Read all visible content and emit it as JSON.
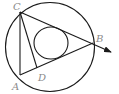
{
  "diagram": {
    "type": "geometry",
    "points": {
      "A": {
        "label": "A"
      },
      "B": {
        "label": "B"
      },
      "C": {
        "label": "C"
      },
      "D": {
        "label": "D"
      }
    },
    "segments": [
      "CA",
      "CB",
      "AB",
      "CD"
    ],
    "ray": "CB (arrow beyond B)",
    "circles": [
      "circumcircle",
      "inner circle"
    ],
    "colors": {
      "line": "#1a1a1a",
      "label": "#8a8a8a",
      "background": "#ffffff"
    }
  }
}
